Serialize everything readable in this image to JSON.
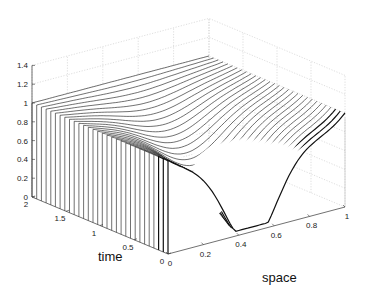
{
  "chart_data": {
    "type": "line",
    "subtype": "3d-waterfall",
    "title": "",
    "xlabel": "space",
    "ylabel": "time",
    "zlabel": "",
    "xlim": [
      0,
      1
    ],
    "ylim": [
      0,
      2
    ],
    "zlim": [
      0,
      1.4
    ],
    "x_ticks": [
      "0",
      "0.2",
      "0.4",
      "0.6",
      "0.8",
      "1"
    ],
    "y_ticks": [
      "0",
      "0.5",
      "1",
      "1.5",
      "2"
    ],
    "z_ticks": [
      "0",
      "0.2",
      "0.4",
      "0.6",
      "0.8",
      "1",
      "1.2",
      "1.4"
    ],
    "grid": true,
    "legend": null,
    "series_count": 30,
    "sample_profiles": [
      {
        "time": 2.0,
        "x": [
          0,
          0.2,
          0.4,
          0.6,
          0.8,
          1.0
        ],
        "values": [
          1.0,
          1.0,
          1.0,
          1.0,
          1.0,
          1.0
        ]
      },
      {
        "time": 1.0,
        "x": [
          0,
          0.2,
          0.4,
          0.6,
          0.8,
          1.0
        ],
        "values": [
          0.85,
          0.8,
          0.7,
          0.65,
          0.8,
          1.0
        ]
      },
      {
        "time": 0.5,
        "x": [
          0,
          0.2,
          0.4,
          0.6,
          0.8,
          1.0
        ],
        "values": [
          0.75,
          0.6,
          0.35,
          0.3,
          0.6,
          1.0
        ]
      },
      {
        "time": 0.0,
        "x": [
          0,
          0.05,
          0.2,
          0.4,
          0.5,
          0.6,
          0.8,
          1.0
        ],
        "values": [
          1.0,
          1.0,
          0.65,
          0.15,
          0.1,
          0.2,
          0.65,
          1.0
        ]
      }
    ]
  },
  "labels": {
    "time": "time",
    "space": "space"
  }
}
